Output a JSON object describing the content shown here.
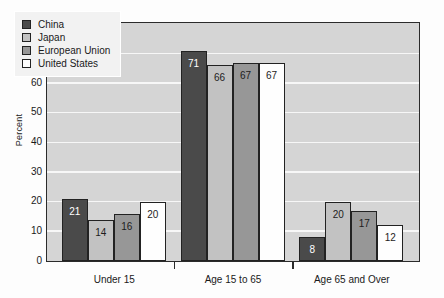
{
  "chart_data": {
    "type": "bar",
    "title": "",
    "xlabel": "",
    "ylabel": "Percent",
    "ylim": [
      0,
      80
    ],
    "yticks": [
      0,
      10,
      20,
      30,
      40,
      50,
      60,
      70,
      80
    ],
    "ytick_labels": [
      "0",
      "10",
      "20",
      "30",
      "40",
      "50",
      "60",
      "70",
      "80"
    ],
    "grid": true,
    "legend_position": "upper-left",
    "categories": [
      "Under 15",
      "Age 15 to 65",
      "Age 65 and Over"
    ],
    "series": [
      {
        "name": "China",
        "key": "China",
        "color": "#4a4a4a",
        "label_color": "light",
        "values": [
          21,
          71,
          8
        ]
      },
      {
        "name": "Japan",
        "key": "Japan",
        "color": "#c2c2c2",
        "label_color": "dark",
        "values": [
          14,
          66,
          20
        ]
      },
      {
        "name": "European Union",
        "key": "EU",
        "color": "#979797",
        "label_color": "dark",
        "values": [
          16,
          67,
          17
        ]
      },
      {
        "name": "United States",
        "key": "US",
        "color": "#fefefe",
        "label_color": "dark",
        "values": [
          20,
          67,
          12
        ]
      }
    ]
  },
  "colors": {
    "plot_background": "#d5d5d5",
    "gridline": "#f7f7f7",
    "axis": "#2b2b2b",
    "page_background": "#fdfdfd",
    "legend_background": "#f2f2f2"
  }
}
